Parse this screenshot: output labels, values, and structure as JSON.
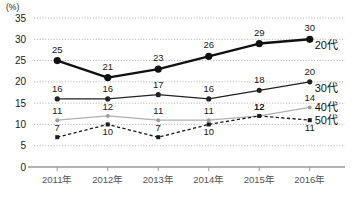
{
  "chart_data": {
    "type": "line",
    "title": "",
    "xlabel": "",
    "ylabel": "",
    "unit_label": "(%)",
    "categories": [
      "2011年",
      "2012年",
      "2013年",
      "2014年",
      "2015年",
      "2016年"
    ],
    "ylim": [
      0,
      35
    ],
    "yticks": [
      0,
      5,
      10,
      15,
      20,
      25,
      30,
      35
    ],
    "grid": true,
    "legend_position": "right-of-last-point",
    "series": [
      {
        "name": "20代",
        "values": [
          25,
          21,
          23,
          26,
          29,
          30
        ],
        "color": "#111111",
        "style": "solid-thick",
        "marker": "circle"
      },
      {
        "name": "30代",
        "values": [
          16,
          16,
          17,
          16,
          18,
          20
        ],
        "color": "#222222",
        "style": "solid",
        "marker": "circle"
      },
      {
        "name": "40代",
        "values": [
          11,
          12,
          11,
          11,
          12,
          14
        ],
        "color": "#b0b0b0",
        "style": "solid-light",
        "marker": "circle"
      },
      {
        "name": "50代",
        "values": [
          7,
          10,
          7,
          10,
          12,
          11
        ],
        "color": "#1a1a1a",
        "style": "dashed",
        "marker": "square"
      }
    ]
  },
  "caption": {
    "text": ""
  }
}
